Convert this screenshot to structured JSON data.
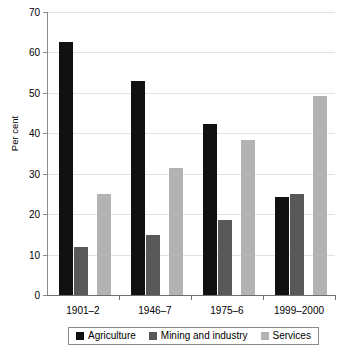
{
  "chart_data": {
    "type": "bar",
    "title": "",
    "subtitle": "",
    "xlabel": "",
    "ylabel": "Per cent",
    "ylim": [
      0,
      70
    ],
    "ytick_step": 10,
    "yticks": [
      "0",
      "10",
      "20",
      "30",
      "40",
      "50",
      "60",
      "70"
    ],
    "grid": true,
    "legend_position": "bottom",
    "categories": [
      "1901–2",
      "1946–7",
      "1975–6",
      "1999–2000"
    ],
    "series": [
      {
        "name": "Agriculture",
        "color": "#111111",
        "values": [
          62.5,
          53.0,
          42.3,
          24.3
        ]
      },
      {
        "name": "Mining and industry",
        "color": "#595959",
        "values": [
          12.0,
          14.8,
          18.5,
          25.0
        ]
      },
      {
        "name": "Services",
        "color": "#b3b3b3",
        "values": [
          25.0,
          31.3,
          38.3,
          49.3
        ]
      }
    ]
  },
  "axes": {
    "y_title": "Per cent"
  },
  "colors": {
    "agriculture": "#111111",
    "mining": "#595959",
    "services": "#b3b3b3",
    "gridline": "#e2e2e2",
    "axis": "#8a8a8a",
    "background": "#ffffff"
  }
}
